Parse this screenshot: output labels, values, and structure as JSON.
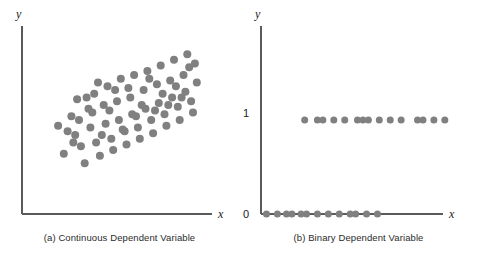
{
  "figure": {
    "background_color": "#ffffff",
    "axis_color": "#5a5a5a",
    "dot_color": "#808080",
    "text_color": "#2b2b2b"
  },
  "chart_data": [
    {
      "type": "scatter",
      "panel_id": "a",
      "title": "(a) Continuous Dependent Variable",
      "xlabel": "x",
      "ylabel": "y",
      "grid": false,
      "legend": "none",
      "xlim": [
        0,
        100
      ],
      "ylim": [
        0,
        100
      ],
      "axis_ticks": [],
      "series": [
        {
          "name": "observations",
          "color": "#808080",
          "marker": "circle",
          "marker_size": 5.2,
          "points": [
            [
              19,
              47
            ],
            [
              22,
              32
            ],
            [
              26,
              52
            ],
            [
              28,
              42
            ],
            [
              29,
              61
            ],
            [
              31,
              36
            ],
            [
              33,
              27
            ],
            [
              35,
              56
            ],
            [
              36,
              46
            ],
            [
              38,
              64
            ],
            [
              39,
              38
            ],
            [
              41,
              31
            ],
            [
              43,
              58
            ],
            [
              44,
              48
            ],
            [
              45,
              68
            ],
            [
              47,
              40
            ],
            [
              48,
              34
            ],
            [
              50,
              60
            ],
            [
              51,
              50
            ],
            [
              52,
              72
            ],
            [
              54,
              44
            ],
            [
              55,
              37
            ],
            [
              57,
              62
            ],
            [
              58,
              53
            ],
            [
              59,
              74
            ],
            [
              61,
              46
            ],
            [
              62,
              40
            ],
            [
              64,
              66
            ],
            [
              65,
              56
            ],
            [
              66,
              76
            ],
            [
              68,
              50
            ],
            [
              69,
              43
            ],
            [
              71,
              69
            ],
            [
              72,
              59
            ],
            [
              73,
              79
            ],
            [
              75,
              53
            ],
            [
              76,
              47
            ],
            [
              78,
              71
            ],
            [
              79,
              62
            ],
            [
              80,
              82
            ],
            [
              82,
              57
            ],
            [
              83,
              50
            ],
            [
              85,
              74
            ],
            [
              86,
              65
            ],
            [
              87,
              85
            ],
            [
              89,
              60
            ],
            [
              90,
              54
            ],
            [
              24,
              44
            ],
            [
              30,
              50
            ],
            [
              37,
              54
            ],
            [
              42,
              42
            ],
            [
              46,
              55
            ],
            [
              53,
              45
            ],
            [
              56,
              67
            ],
            [
              60,
              52
            ],
            [
              63,
              58
            ],
            [
              67,
              72
            ],
            [
              70,
              55
            ],
            [
              74,
              64
            ],
            [
              77,
              58
            ],
            [
              81,
              68
            ],
            [
              84,
              62
            ],
            [
              88,
              78
            ],
            [
              27,
              38
            ],
            [
              34,
              62
            ],
            [
              49,
              66
            ],
            [
              92,
              70
            ],
            [
              91,
              80
            ],
            [
              40,
              70
            ]
          ]
        }
      ]
    },
    {
      "type": "scatter",
      "panel_id": "b",
      "title": "(b) Binary Dependent Variable",
      "xlabel": "x",
      "ylabel": "y",
      "grid": false,
      "legend": "none",
      "xlim": [
        0,
        100
      ],
      "ylim": [
        0,
        2
      ],
      "axis_ticks": [
        {
          "value": 1,
          "label": "1"
        },
        {
          "value": 0,
          "label": "0"
        }
      ],
      "series": [
        {
          "name": "y = 1",
          "color": "#808080",
          "marker": "circle",
          "marker_size": 4.6,
          "y_value": 1,
          "x_values": [
            24,
            31,
            34,
            40,
            46,
            53,
            56,
            59,
            65,
            71,
            77,
            86,
            89,
            95,
            101
          ]
        },
        {
          "name": "y = 0",
          "color": "#808080",
          "marker": "circle",
          "marker_size": 4.6,
          "y_value": 0,
          "x_values": [
            3,
            9,
            14,
            17,
            22,
            25,
            31,
            37,
            43,
            49,
            52,
            58,
            64
          ]
        }
      ]
    }
  ],
  "panels": [
    {
      "id": "a",
      "caption": "(a) Continuous Dependent Variable",
      "x_axis_label": "x",
      "y_axis_label": "y"
    },
    {
      "id": "b",
      "caption": "(b) Binary Dependent Variable",
      "x_axis_label": "x",
      "y_axis_label": "y",
      "y_tick_top": "1",
      "y_tick_bottom": "0"
    }
  ]
}
